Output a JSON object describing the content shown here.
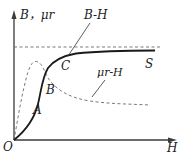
{
  "diagram": {
    "y_axis_label": "B，μr",
    "x_axis_label": "H",
    "origin_label": "O",
    "curves": [
      {
        "name": "B-H",
        "style": "solid",
        "label": "B-H"
      },
      {
        "name": "μr-H",
        "style": "dashed",
        "label": "μr-H"
      }
    ],
    "points": {
      "A": "A",
      "B": "B",
      "C": "C",
      "S": "S"
    },
    "asymptote": {
      "style": "dashed",
      "description": "saturation level"
    },
    "colors": {
      "axis": "#3a3a3a",
      "bh_curve": "#1a1a1a",
      "mu_curve": "#6a6a6a",
      "asymptote": "#6a6a6a",
      "text": "#222222"
    }
  }
}
